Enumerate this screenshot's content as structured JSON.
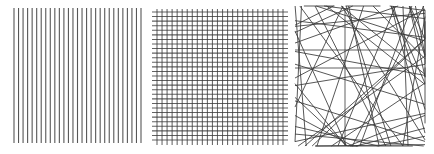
{
  "figure": {
    "stroke_color": "#3a3a3a",
    "background": "#ffffff",
    "panels": [
      {
        "id": "parallel",
        "type": "parallel-vertical-lines",
        "line_count": 29,
        "x_start": 14,
        "x_end": 141,
        "y_start": 8,
        "y_end": 143
      },
      {
        "id": "grid",
        "type": "orthogonal-grid",
        "vertical_count": 26,
        "horizontal_count": 29,
        "v_x_start": 157,
        "v_x_end": 283,
        "v_y_start": 9,
        "v_y_end": 145,
        "h_y_start": 12,
        "h_y_end": 140,
        "h_x_start": 152,
        "h_x_end": 288
      },
      {
        "id": "random",
        "type": "random-lines",
        "x_min": 295,
        "x_max": 425,
        "y_min": 6,
        "y_max": 146,
        "line_count": 60,
        "seed": 7
      }
    ]
  }
}
